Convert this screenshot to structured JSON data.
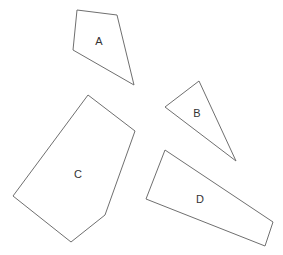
{
  "diagram": {
    "type": "polygon-shapes",
    "stroke_color": "#6f6f6f",
    "label_color": "#333333",
    "background": "#ffffff",
    "shapes": [
      {
        "label": "A",
        "points": "77,10 117,15 134,85 73,50",
        "label_x": 99,
        "label_y": 41
      },
      {
        "label": "B",
        "points": "199,81 165,107 236,161",
        "label_x": 197,
        "label_y": 113
      },
      {
        "label": "C",
        "points": "88,95 135,131 105,215 71,242 13,196",
        "label_x": 78,
        "label_y": 174
      },
      {
        "label": "D",
        "points": "165,150 273,222 265,246 146,199",
        "label_x": 200,
        "label_y": 199
      }
    ]
  }
}
